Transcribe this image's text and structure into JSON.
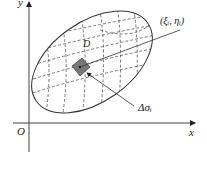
{
  "diagram": {
    "axes": {
      "x_label": "x",
      "y_label": "y",
      "origin_label": "O"
    },
    "region_label": "D",
    "point_label": "(ξᵢ, ηᵢ)",
    "subregion_label": "Δσᵢ",
    "colors": {
      "stroke": "#333333",
      "shaded": "#777777",
      "background": "#ffffff"
    }
  }
}
